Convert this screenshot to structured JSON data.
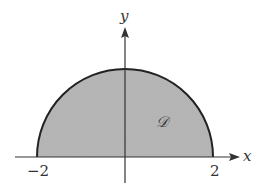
{
  "diagram": {
    "type": "region-plot",
    "axes": {
      "x_label": "x",
      "y_label": "y"
    },
    "ticks": {
      "left": "−2",
      "right": "2"
    },
    "region": {
      "label": "𝒟",
      "shape": "semicircle",
      "radius": 2,
      "fill_color": "#b4b4b4",
      "stroke_color": "#222222"
    }
  }
}
